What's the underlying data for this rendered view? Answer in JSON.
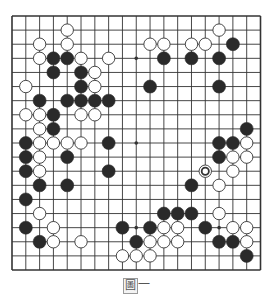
{
  "diagram": {
    "type": "go-board",
    "size": 19,
    "geometry": {
      "left": 12,
      "top": 16,
      "right": 260.5,
      "bottom": 270
    },
    "colors": {
      "line": "#333333",
      "black_stone": "#2a2a2a",
      "white_stone": "#ffffff",
      "stone_outline": "#333333",
      "star": "#333333",
      "border": "#222222"
    },
    "star_points": [
      [
        3,
        3
      ],
      [
        9,
        3
      ],
      [
        15,
        3
      ],
      [
        3,
        9
      ],
      [
        9,
        9
      ],
      [
        15,
        9
      ],
      [
        3,
        15
      ],
      [
        9,
        15
      ],
      [
        15,
        15
      ]
    ],
    "black_stones": [
      [
        16,
        2
      ],
      [
        3,
        3
      ],
      [
        4,
        3
      ],
      [
        11,
        3
      ],
      [
        13,
        3
      ],
      [
        15,
        3
      ],
      [
        3,
        4
      ],
      [
        5,
        4
      ],
      [
        5,
        5
      ],
      [
        10,
        5
      ],
      [
        15,
        5
      ],
      [
        2,
        6
      ],
      [
        4,
        6
      ],
      [
        5,
        6
      ],
      [
        6,
        6
      ],
      [
        7,
        6
      ],
      [
        3,
        7
      ],
      [
        3,
        8
      ],
      [
        17,
        8
      ],
      [
        1,
        9
      ],
      [
        7,
        9
      ],
      [
        15,
        9
      ],
      [
        16,
        9
      ],
      [
        1,
        10
      ],
      [
        4,
        10
      ],
      [
        15,
        10
      ],
      [
        1,
        11
      ],
      [
        7,
        11
      ],
      [
        2,
        12
      ],
      [
        4,
        12
      ],
      [
        13,
        12
      ],
      [
        1,
        13
      ],
      [
        11,
        14
      ],
      [
        12,
        14
      ],
      [
        13,
        14
      ],
      [
        1,
        15
      ],
      [
        8,
        15
      ],
      [
        10,
        15
      ],
      [
        14,
        15
      ],
      [
        2,
        16
      ],
      [
        9,
        16
      ],
      [
        15,
        16
      ],
      [
        16,
        16
      ],
      [
        17,
        17
      ]
    ],
    "white_stones": [
      [
        4,
        1
      ],
      [
        15,
        1
      ],
      [
        2,
        2
      ],
      [
        4,
        2
      ],
      [
        10,
        2
      ],
      [
        11,
        2
      ],
      [
        13,
        2
      ],
      [
        14,
        2
      ],
      [
        2,
        3
      ],
      [
        5,
        3
      ],
      [
        7,
        3
      ],
      [
        6,
        4
      ],
      [
        1,
        5
      ],
      [
        6,
        5
      ],
      [
        1,
        7
      ],
      [
        2,
        7
      ],
      [
        5,
        7
      ],
      [
        6,
        7
      ],
      [
        2,
        8
      ],
      [
        2,
        9
      ],
      [
        3,
        9
      ],
      [
        4,
        9
      ],
      [
        5,
        9
      ],
      [
        17,
        9
      ],
      [
        2,
        10
      ],
      [
        16,
        10
      ],
      [
        17,
        10
      ],
      [
        2,
        11
      ],
      [
        14,
        11
      ],
      [
        16,
        11
      ],
      [
        15,
        12
      ],
      [
        2,
        14
      ],
      [
        15,
        14
      ],
      [
        3,
        15
      ],
      [
        11,
        15
      ],
      [
        12,
        15
      ],
      [
        16,
        15
      ],
      [
        17,
        15
      ],
      [
        3,
        16
      ],
      [
        5,
        16
      ],
      [
        10,
        16
      ],
      [
        11,
        16
      ],
      [
        12,
        16
      ],
      [
        17,
        16
      ],
      [
        8,
        17
      ],
      [
        9,
        17
      ],
      [
        10,
        17
      ]
    ],
    "marked_stones": [
      {
        "point": [
          14,
          11
        ],
        "color": "white",
        "marker": "circle"
      }
    ]
  },
  "caption": {
    "icon_char": "圖",
    "text": "一"
  }
}
